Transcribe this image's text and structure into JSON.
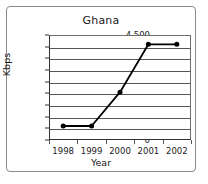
{
  "chart_data": {
    "type": "line",
    "title": "Ghana",
    "xlabel": "Year",
    "ylabel": "Kbps",
    "categories": [
      "1998",
      "1999",
      "2000",
      "2001",
      "2002"
    ],
    "values": [
      600,
      600,
      2050,
      4100,
      4100
    ],
    "series": [
      {
        "name": "Kbps",
        "values": [
          600,
          600,
          2050,
          4100,
          4100
        ]
      }
    ],
    "ylim": [
      0,
      4500
    ],
    "ytick_labels": [
      "0",
      "500",
      "1,000",
      "1,500",
      "2,000",
      "2,500",
      "3,000",
      "3,500",
      "4,000",
      "4,500"
    ],
    "ytick_values": [
      0,
      500,
      1000,
      1500,
      2000,
      2500,
      3000,
      3500,
      4000,
      4500
    ],
    "grid": "horizontal",
    "legend": "none",
    "marker": "filled-circle",
    "line_color": "#000000",
    "grid_color": "#555555",
    "border_color": "#8a8a8a"
  }
}
